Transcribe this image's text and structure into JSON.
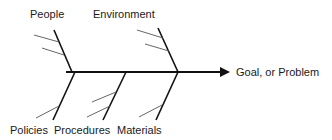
{
  "diagram": {
    "type": "fishbone",
    "goal": "Goal, or Problem",
    "categories_top": [
      "People",
      "Environment"
    ],
    "categories_bottom": [
      "Policies",
      "Procedures",
      "Materials"
    ],
    "colors": {
      "line": "#111111",
      "sub_line": "#555555",
      "text": "#1a1a1a"
    }
  }
}
